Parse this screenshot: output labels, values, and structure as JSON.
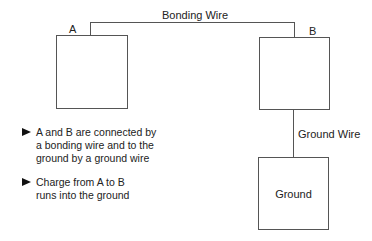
{
  "diagram": {
    "nodes": [
      {
        "id": "A",
        "label": "A"
      },
      {
        "id": "B",
        "label": "B"
      },
      {
        "id": "ground",
        "label": "Ground"
      }
    ],
    "edges": [
      {
        "from": "A",
        "to": "B",
        "label": "Bonding Wire"
      },
      {
        "from": "B",
        "to": "ground",
        "label": "Ground Wire"
      }
    ]
  },
  "labels": {
    "a": "A",
    "b": "B",
    "bonding_wire": "Bonding Wire",
    "ground_wire": "Ground Wire",
    "ground": "Ground"
  },
  "bullets": [
    {
      "text": "A and B are connected by a bonding wire and to the ground by a ground wire"
    },
    {
      "text": "Charge from A to B runs into the ground"
    }
  ],
  "colors": {
    "line": "#555555",
    "text": "#222222",
    "background": "#ffffff"
  }
}
